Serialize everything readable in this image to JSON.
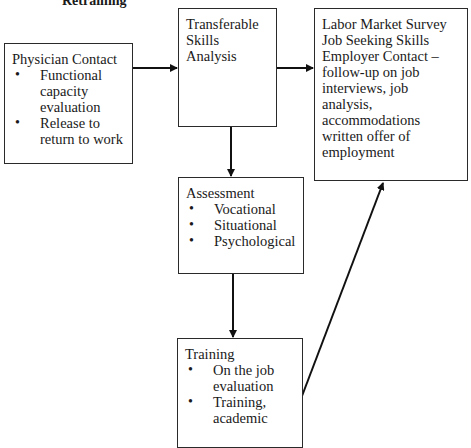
{
  "title": "Retraining",
  "boxes": {
    "physician": {
      "heading": "Physician Contact",
      "items": [
        "Functional capacity evaluation",
        "Release to return to work"
      ]
    },
    "transferable": {
      "lines": [
        "Transferable",
        "Skills",
        "Analysis"
      ]
    },
    "labor": {
      "lines": [
        "Labor Market Survey",
        "Job Seeking Skills",
        "Employer Contact –",
        "follow-up on job",
        "interviews, job",
        "analysis,",
        "accommodations",
        "written offer of",
        "employment"
      ]
    },
    "assessment": {
      "heading": "Assessment",
      "items": [
        "Vocational",
        "Situational",
        "Psychological"
      ]
    },
    "training": {
      "heading": "Training",
      "items": [
        "On the job evaluation",
        "Training, academic"
      ]
    }
  },
  "connections": [
    {
      "from": "physician",
      "to": "transferable"
    },
    {
      "from": "transferable",
      "to": "labor"
    },
    {
      "from": "transferable",
      "to": "assessment"
    },
    {
      "from": "assessment",
      "to": "training"
    },
    {
      "from": "training",
      "to": "labor"
    }
  ]
}
